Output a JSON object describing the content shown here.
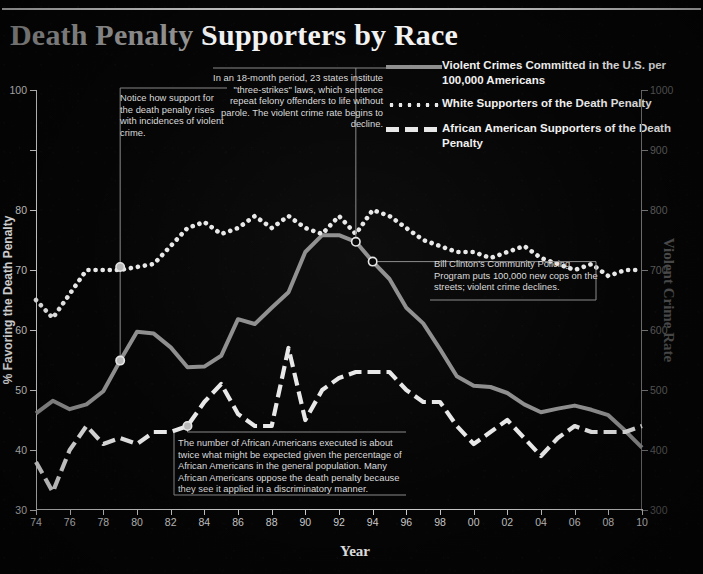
{
  "title": {
    "part1": "Death Penalty",
    "part2": "Supporters by Race"
  },
  "legend": [
    {
      "id": "violent-crime",
      "style": "solid",
      "color": "#8e8e8e",
      "label": "Violent Crimes Committed in the U.S. per 100,000 Americans"
    },
    {
      "id": "white-supporters",
      "style": "dotted",
      "color": "#e8e8e8",
      "label": "White Supporters of the Death Penalty"
    },
    {
      "id": "black-supporters",
      "style": "dashed",
      "color": "#e8e8e8",
      "label": "African American Supporters of the Death Penalty"
    }
  ],
  "axes": {
    "y_left_label": "% Favoring the Death Penalty",
    "y_right_label": "Violent Crime Rate",
    "x_label": "Year",
    "y_left_ticks": [
      "100",
      "",
      "80",
      "70",
      "60",
      "50",
      "40",
      "30"
    ],
    "y_right_ticks": [
      "1000",
      "900",
      "800",
      "700",
      "600",
      "500",
      "400",
      "300"
    ],
    "x_ticks": [
      "74",
      "76",
      "78",
      "80",
      "82",
      "84",
      "86",
      "88",
      "90",
      "92",
      "94",
      "96",
      "98",
      "00",
      "02",
      "04",
      "06",
      "08",
      "10"
    ]
  },
  "annotations": [
    {
      "id": "anno-support-rises",
      "text": "Notice how support for the death penalty rises with incidences of violent crime."
    },
    {
      "id": "anno-three-strikes",
      "text": "In an 18-month period, 23 states institute \"three-strikes\" laws, which sentence repeat felony offenders to life without parole. The violent crime rate begins to decline."
    },
    {
      "id": "anno-clinton-policing",
      "text": "Bill Clinton's Community Policing Program puts 100,000 new cops on the streets; violent crime declines."
    },
    {
      "id": "anno-discrimination",
      "text": "The number of African Americans executed is about twice what might be expected given the percentage of African Americans in the general population. Many African Americans oppose the death penalty because they see it applied in a discriminatory manner."
    }
  ],
  "colors": {
    "background": "#050505",
    "title_gray": "#9a9a9a",
    "title_white": "#f2f2f2",
    "violent_crime_line": "#8e8e8e",
    "supporter_lines": "#e8e8e8",
    "axis": "#cfcfcf",
    "right_axis": "#5d5d5d"
  },
  "chart_data": {
    "type": "line",
    "title": "Death Penalty Supporters by Race",
    "xlabel": "Year",
    "ylabel": "% Favoring the Death Penalty",
    "y2label": "Violent Crime Rate",
    "xlim": [
      1974,
      2010
    ],
    "ylim": [
      30,
      100
    ],
    "y2lim": [
      300,
      1000
    ],
    "grid": false,
    "legend_position": "top-right",
    "x": [
      1974,
      1975,
      1976,
      1977,
      1978,
      1979,
      1980,
      1981,
      1982,
      1983,
      1984,
      1985,
      1986,
      1987,
      1988,
      1989,
      1990,
      1991,
      1992,
      1993,
      1994,
      1995,
      1996,
      1997,
      1998,
      1999,
      2000,
      2001,
      2002,
      2003,
      2004,
      2005,
      2006,
      2007,
      2008,
      2009,
      2010
    ],
    "series": [
      {
        "name": "White Supporters of the Death Penalty",
        "axis": "left",
        "style": "dotted",
        "values": [
          65,
          62,
          66,
          70,
          70,
          70,
          70.5,
          71,
          74,
          77,
          78,
          76,
          77,
          79,
          77,
          79,
          77,
          76,
          79,
          76,
          80,
          79,
          77,
          75,
          74,
          73,
          73,
          72,
          73,
          74,
          72,
          71,
          70,
          71,
          69,
          70,
          70
        ]
      },
      {
        "name": "African American Supporters of the Death Penalty",
        "axis": "left",
        "style": "dashed",
        "values": [
          38,
          33,
          40,
          44,
          41,
          42,
          41,
          43,
          43,
          44,
          48,
          51,
          46,
          44,
          44,
          57,
          45,
          50,
          52,
          53,
          53,
          53,
          50,
          48,
          48,
          44,
          41,
          43,
          45,
          42,
          39,
          42,
          44,
          43,
          43,
          43,
          44
        ]
      },
      {
        "name": "Violent Crimes Committed in the U.S. per 100,000 Americans",
        "axis": "right",
        "style": "solid",
        "values": [
          461,
          482,
          468,
          476,
          498,
          549,
          597,
          594,
          571,
          538,
          539,
          557,
          618,
          610,
          637,
          663,
          730,
          758,
          758,
          747,
          714,
          685,
          637,
          611,
          568,
          523,
          507,
          505,
          495,
          476,
          463,
          469,
          474,
          467,
          458,
          432,
          404
        ]
      }
    ],
    "markers": [
      {
        "series": "White Supporters of the Death Penalty",
        "year": 1979,
        "value": 70.5
      },
      {
        "series": "Violent Crimes Committed in the U.S. per 100,000 Americans",
        "year": 1979,
        "value": 549
      },
      {
        "series": "Violent Crimes Committed in the U.S. per 100,000 Americans",
        "year": 1993,
        "value": 747
      },
      {
        "series": "Violent Crimes Committed in the U.S. per 100,000 Americans",
        "year": 1994,
        "value": 714
      }
    ]
  }
}
